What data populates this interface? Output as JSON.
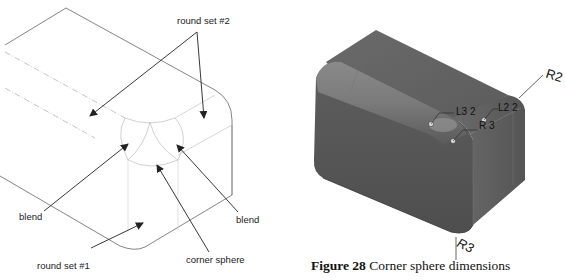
{
  "left_figure": {
    "labels": {
      "round_set_2": "round set #2",
      "blend_left": "blend",
      "blend_right": "blend",
      "corner_sphere": "corner sphere",
      "round_set_1": "round set #1"
    }
  },
  "right_figure": {
    "dimensions": {
      "l3": "L3 2",
      "l2": "L2 2",
      "r_inner": "R 3",
      "r2": "R2",
      "r3": "R3"
    },
    "caption": {
      "number": "Figure 28",
      "text": "Corner sphere dimensions"
    }
  },
  "colors": {
    "wire_edge": "#555555",
    "wire_hidden": "#bbbbbb",
    "arrow": "#222222",
    "model_dark": "#5a5a5a",
    "model_mid": "#707070",
    "model_light": "#8a8a8a"
  }
}
